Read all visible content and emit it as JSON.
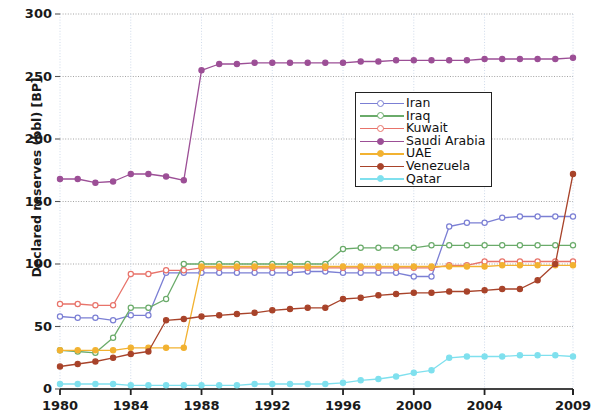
{
  "chart_data": {
    "type": "line",
    "title": "",
    "xlabel": "",
    "ylabel": "Declared reserves (bbl) [BP]",
    "xlim": [
      1980,
      2009
    ],
    "ylim": [
      0,
      300
    ],
    "yticks": [
      0,
      50,
      100,
      150,
      200,
      250,
      300
    ],
    "xticks": [
      1980,
      1984,
      1988,
      1992,
      1996,
      2000,
      2004,
      2009
    ],
    "grid": true,
    "legend_position": "upper center",
    "x": [
      1980,
      1981,
      1982,
      1983,
      1984,
      1985,
      1986,
      1987,
      1988,
      1989,
      1990,
      1991,
      1992,
      1993,
      1994,
      1995,
      1996,
      1997,
      1998,
      1999,
      2000,
      2001,
      2002,
      2003,
      2004,
      2005,
      2006,
      2007,
      2008,
      2009
    ],
    "series": [
      {
        "name": "Iran",
        "color": "#7b7fd4",
        "marker": "open-circle",
        "values": [
          58,
          57,
          57,
          55,
          59,
          59,
          93,
          93,
          93,
          93,
          93,
          93,
          93,
          93,
          94,
          94,
          93,
          93,
          93,
          93,
          90,
          90,
          130,
          133,
          133,
          137,
          138,
          138,
          138,
          138
        ]
      },
      {
        "name": "Iraq",
        "color": "#6aab6a",
        "marker": "open-circle",
        "values": [
          31,
          30,
          29,
          41,
          65,
          65,
          72,
          100,
          100,
          100,
          100,
          100,
          100,
          100,
          100,
          100,
          112,
          113,
          113,
          113,
          113,
          115,
          115,
          115,
          115,
          115,
          115,
          115,
          115,
          115
        ]
      },
      {
        "name": "Kuwait",
        "color": "#e8736a",
        "marker": "open-circle",
        "values": [
          68,
          68,
          67,
          67,
          92,
          92,
          95,
          95,
          97,
          97,
          97,
          97,
          97,
          97,
          97,
          97,
          97,
          97,
          97,
          97,
          97,
          97,
          99,
          99,
          102,
          102,
          102,
          102,
          102,
          102
        ]
      },
      {
        "name": "Saudi Arabia",
        "color": "#9c4f96",
        "marker": "filled-circle",
        "values": [
          168,
          168,
          165,
          166,
          172,
          172,
          170,
          167,
          255,
          260,
          260,
          261,
          261,
          261,
          261,
          261,
          261,
          262,
          262,
          263,
          263,
          263,
          263,
          263,
          264,
          264,
          264,
          264,
          264,
          265
        ]
      },
      {
        "name": "UAE",
        "color": "#f2b231",
        "marker": "filled-circle",
        "values": [
          31,
          31,
          31,
          31,
          33,
          33,
          33,
          33,
          98,
          98,
          98,
          98,
          98,
          98,
          98,
          98,
          98,
          98,
          98,
          98,
          98,
          98,
          98,
          98,
          98,
          99,
          99,
          99,
          99,
          99
        ]
      },
      {
        "name": "Venezuela",
        "color": "#a8432a",
        "marker": "filled-circle",
        "values": [
          18,
          20,
          22,
          25,
          28,
          30,
          55,
          56,
          58,
          59,
          60,
          61,
          63,
          64,
          65,
          65,
          72,
          73,
          75,
          76,
          77,
          77,
          78,
          78,
          79,
          80,
          80,
          87,
          100,
          172
        ]
      },
      {
        "name": "Qatar",
        "color": "#7fe0ee",
        "marker": "filled-circle",
        "values": [
          4,
          4,
          4,
          4,
          3,
          3,
          3,
          3,
          3,
          3,
          3,
          4,
          4,
          4,
          4,
          4,
          5,
          7,
          8,
          10,
          13,
          15,
          25,
          26,
          26,
          26,
          27,
          27,
          27,
          26
        ]
      }
    ]
  }
}
